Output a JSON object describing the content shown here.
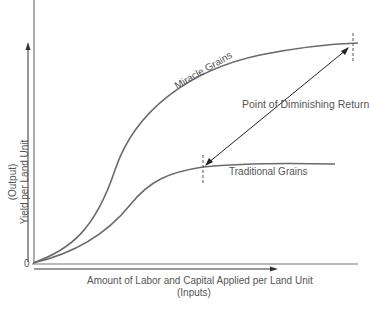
{
  "diagram": {
    "type": "production-curve-comparison",
    "curves": [
      {
        "name": "Miracle Grains",
        "label": "Miracle Grains"
      },
      {
        "name": "Traditional Grains",
        "label": "Traditional Grains"
      }
    ],
    "annotation": "Point of Diminishing Return",
    "x_axis": {
      "label": "Amount of Labor and Capital Applied per Land Unit",
      "sublabel": "(Inputs)"
    },
    "y_axis": {
      "label": "Yield per Land Unit",
      "sublabel": "(Output)"
    },
    "origin_label": "0",
    "colors": {
      "curve": "#666666",
      "arrow": "#222222",
      "text": "#555555"
    }
  }
}
